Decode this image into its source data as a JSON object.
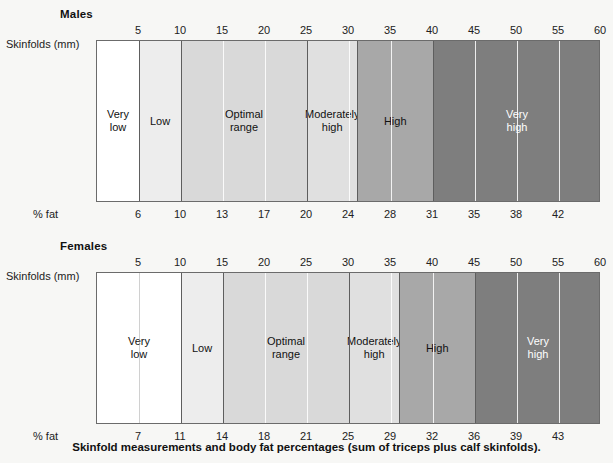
{
  "caption": "Skinfold measurements and body fat percentages (sum of triceps plus calf skinfolds).",
  "labels": {
    "skinfolds": "Skinfolds (mm)",
    "pct_fat": "% fat"
  },
  "colors": {
    "very_low": "#ffffff",
    "low": "#ededed",
    "optimal": "#d9d9d9",
    "moderately_high": "#e0e0e0",
    "high": "#a8a8a8",
    "very_high": "#7e7e7e",
    "border": "#6b6b6b",
    "page_background": "#f7f7f5"
  },
  "chart_data": {
    "type": "bar",
    "title": "Skinfold measurements and body fat percentages (sum of triceps plus calf skinfolds).",
    "xlabel": "Skinfolds (mm)",
    "ylabel": "",
    "xlim": [
      0,
      60
    ],
    "grid": true,
    "legend": "none",
    "series": [
      {
        "name": "Males",
        "skinfold_ticks": [
          5,
          10,
          15,
          20,
          25,
          30,
          35,
          40,
          45,
          50,
          55,
          60
        ],
        "pct_fat_ticks": [
          6,
          10,
          13,
          17,
          20,
          24,
          28,
          31,
          35,
          38,
          42
        ],
        "bands": [
          {
            "label": "Very\nlow",
            "label_line1": "Very",
            "label_line2": "low",
            "start_mm": 0,
            "end_mm": 5,
            "color": "#ffffff",
            "text": "dark"
          },
          {
            "label": "Low",
            "label_line1": "Low",
            "label_line2": "",
            "start_mm": 5,
            "end_mm": 10,
            "color": "#ededed",
            "text": "dark"
          },
          {
            "label": "Optimal\nrange",
            "label_line1": "Optimal",
            "label_line2": "range",
            "start_mm": 10,
            "end_mm": 25,
            "color": "#d9d9d9",
            "text": "dark"
          },
          {
            "label": "Moderately\nhigh",
            "label_line1": "Moderately",
            "label_line2": "high",
            "start_mm": 25,
            "end_mm": 31,
            "color": "#e0e0e0",
            "text": "dark"
          },
          {
            "label": "High",
            "label_line1": "High",
            "label_line2": "",
            "start_mm": 31,
            "end_mm": 40,
            "color": "#a8a8a8",
            "text": "dark"
          },
          {
            "label": "Very\nhigh",
            "label_line1": "Very",
            "label_line2": "high",
            "start_mm": 40,
            "end_mm": 60,
            "color": "#7e7e7e",
            "text": "light"
          }
        ]
      },
      {
        "name": "Females",
        "skinfold_ticks": [
          5,
          10,
          15,
          20,
          25,
          30,
          35,
          40,
          45,
          50,
          55,
          60
        ],
        "pct_fat_ticks": [
          7,
          11,
          14,
          18,
          21,
          25,
          29,
          32,
          36,
          39,
          43
        ],
        "bands": [
          {
            "label": "Very\nlow",
            "label_line1": "Very",
            "label_line2": "low",
            "start_mm": 0,
            "end_mm": 10,
            "color": "#ffffff",
            "text": "dark"
          },
          {
            "label": "Low",
            "label_line1": "Low",
            "label_line2": "",
            "start_mm": 10,
            "end_mm": 15,
            "color": "#ededed",
            "text": "dark"
          },
          {
            "label": "Optimal\nrange",
            "label_line1": "Optimal",
            "label_line2": "range",
            "start_mm": 15,
            "end_mm": 30,
            "color": "#d9d9d9",
            "text": "dark"
          },
          {
            "label": "Moderately\nhigh",
            "label_line1": "Moderately",
            "label_line2": "high",
            "start_mm": 30,
            "end_mm": 36,
            "color": "#e0e0e0",
            "text": "dark"
          },
          {
            "label": "High",
            "label_line1": "High",
            "label_line2": "",
            "start_mm": 36,
            "end_mm": 45,
            "color": "#a8a8a8",
            "text": "dark"
          },
          {
            "label": "Very\nhigh",
            "label_line1": "Very",
            "label_line2": "high",
            "start_mm": 45,
            "end_mm": 60,
            "color": "#7e7e7e",
            "text": "light"
          }
        ]
      }
    ]
  },
  "males": {
    "title": "Males"
  },
  "females": {
    "title": "Females"
  }
}
